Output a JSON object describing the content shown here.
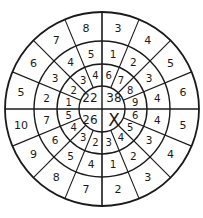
{
  "puzzle": {
    "title": "",
    "center_quadrants": {
      "top_left": "22",
      "top_right": "38",
      "bottom_left": "26",
      "bottom_right": "X"
    },
    "sectors_per_ring": 16,
    "order": "clockwise starting at 12 o'clock",
    "rings": {
      "inner": [
        "6",
        "7",
        "8",
        "9",
        "6",
        "5",
        "4",
        "3",
        "2",
        "3",
        "4",
        "5",
        "1",
        "2",
        "3",
        "4"
      ],
      "middle": [
        "1",
        "2",
        "3",
        "4",
        "4",
        "3",
        "2",
        "1",
        "4",
        "5",
        "6",
        "7",
        "2",
        "3",
        "4",
        "5"
      ],
      "outer": [
        "3",
        "4",
        "5",
        "6",
        "5",
        "4",
        "3",
        "2",
        "7",
        "8",
        "9",
        "10",
        "5",
        "6",
        "7",
        "8"
      ]
    },
    "colors": {
      "line": "#1a1a1a",
      "background": "#ffffff"
    }
  }
}
